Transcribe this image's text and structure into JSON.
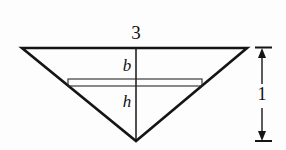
{
  "figure": {
    "type": "geometry-diagram",
    "background_color": "#fdfdfd",
    "stroke_color": "#151515",
    "labels": {
      "top_width": "3",
      "rectangle_width": "b",
      "rectangle_height_marker": "h",
      "vertical_dimension": "1"
    },
    "shapes": {
      "triangle": {
        "name": "inverted-triangle",
        "top_left": [
          22,
          48
        ],
        "top_right": [
          247,
          48
        ],
        "apex": [
          136,
          141
        ],
        "stroke_width": 2.6
      },
      "center_axis": {
        "name": "center-vertical-line",
        "x": 136,
        "y_top": 48,
        "y_bottom": 141,
        "stroke_width": 1.5
      },
      "inner_rectangle": {
        "name": "inscribed-rectangle",
        "left": 68,
        "right": 202,
        "top": 79,
        "bottom": 86,
        "stroke_width": 1.1
      },
      "dimension_line": {
        "name": "height-dimension",
        "x": 262,
        "y_top": 48,
        "y_bottom": 141,
        "tick_left": 255,
        "tick_right": 272,
        "stroke_width": 1.4
      }
    }
  }
}
